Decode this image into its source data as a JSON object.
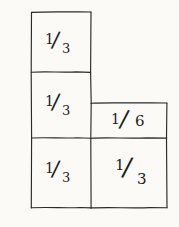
{
  "figure": {
    "kind": "hand-drawn-fraction-diagram",
    "background_color": "#fbfaf7",
    "ink_color": "#1d1d1d",
    "width": 179,
    "height": 227
  },
  "cells": [
    {
      "id": "left-top",
      "label": "1/3",
      "numerator": "1",
      "slash": "/",
      "denominator": "3",
      "x": 31,
      "y": 12,
      "w": 60,
      "h": 60
    },
    {
      "id": "left-middle",
      "label": "1/3",
      "numerator": "1",
      "slash": "/",
      "denominator": "3",
      "x": 31,
      "y": 72,
      "w": 60,
      "h": 66
    },
    {
      "id": "left-bottom",
      "label": "1/3",
      "numerator": "1",
      "slash": "/",
      "denominator": "3",
      "x": 31,
      "y": 138,
      "w": 60,
      "h": 70
    },
    {
      "id": "right-top",
      "label": "1/6",
      "numerator": "1",
      "slash": "/",
      "denominator": "6",
      "x": 91,
      "y": 103,
      "w": 76,
      "h": 35
    },
    {
      "id": "right-bottom",
      "label": "1/3",
      "numerator": "1",
      "slash": "/",
      "denominator": "3",
      "x": 91,
      "y": 138,
      "w": 76,
      "h": 70
    }
  ]
}
